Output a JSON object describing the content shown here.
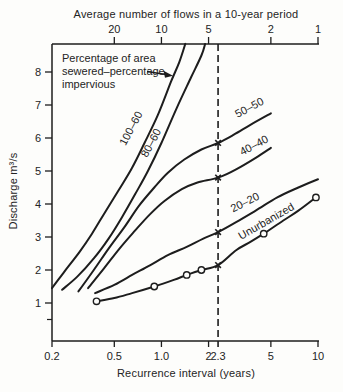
{
  "chart_data": {
    "type": "line",
    "top_axis_title": "Average number of flows in a 10-year period",
    "xlabel": "Recurrence interval (years)",
    "ylabel": "Discharge m³/s",
    "x_scale": "log",
    "xlim": [
      0.2,
      10
    ],
    "ylim": [
      0,
      9
    ],
    "grid": false,
    "x_ticks_bottom": [
      {
        "t": 0.2,
        "label": "0.2"
      },
      {
        "t": 0.5,
        "label": "0.5"
      },
      {
        "t": 1.0,
        "label": "1.0"
      },
      {
        "t": 2,
        "label": "2"
      },
      {
        "t": 2.3,
        "label": "2.3",
        "tick": false
      },
      {
        "t": 5,
        "label": "5"
      },
      {
        "t": 10,
        "label": "10"
      }
    ],
    "x_ticks_top": [
      {
        "t": 0.5,
        "label": "20"
      },
      {
        "t": 1,
        "label": "10"
      },
      {
        "t": 2,
        "label": "5"
      },
      {
        "t": 5,
        "label": "2"
      },
      {
        "t": 10,
        "label": "1"
      }
    ],
    "y_ticks": [
      1,
      2,
      3,
      4,
      5,
      6,
      7,
      8
    ],
    "y_minor_ticks": [
      0.5
    ],
    "reference_line": {
      "x": 2.3,
      "style": "dashed"
    },
    "annotation": {
      "lines": [
        "Percentage of area",
        "sewered–percentage",
        "impervious"
      ],
      "points_to": "100–60"
    },
    "series": [
      {
        "name": "100–60",
        "label_at": [
          0.67,
          6.24
        ],
        "label_angle": -62,
        "points": [
          [
            0.2,
            1.45
          ],
          [
            0.24,
            1.95
          ],
          [
            0.3,
            2.55
          ],
          [
            0.36,
            3.1
          ],
          [
            0.43,
            3.7
          ],
          [
            0.53,
            4.4
          ],
          [
            0.65,
            5.1
          ],
          [
            0.78,
            5.85
          ],
          [
            0.95,
            6.7
          ],
          [
            1.15,
            7.7
          ],
          [
            1.3,
            8.3
          ],
          [
            1.42,
            8.85
          ]
        ]
      },
      {
        "name": "80–60",
        "label_at": [
          0.9,
          5.8
        ],
        "label_angle": -62,
        "points": [
          [
            0.232,
            1.4
          ],
          [
            0.29,
            1.8
          ],
          [
            0.37,
            2.35
          ],
          [
            0.46,
            2.95
          ],
          [
            0.56,
            3.6
          ],
          [
            0.68,
            4.3
          ],
          [
            0.82,
            5.0
          ],
          [
            1.0,
            5.85
          ],
          [
            1.25,
            6.9
          ],
          [
            1.55,
            7.85
          ],
          [
            1.8,
            8.5
          ],
          [
            1.9,
            8.85
          ]
        ]
      },
      {
        "name": "50–50",
        "label_at": [
          3.74,
          6.82
        ],
        "label_angle": -28,
        "cross_at": 5.85,
        "points": [
          [
            0.295,
            1.35
          ],
          [
            0.37,
            2.0
          ],
          [
            0.46,
            2.65
          ],
          [
            0.58,
            3.3
          ],
          [
            0.72,
            3.95
          ],
          [
            0.9,
            4.5
          ],
          [
            1.1,
            4.95
          ],
          [
            1.4,
            5.35
          ],
          [
            1.8,
            5.65
          ],
          [
            2.3,
            5.85
          ],
          [
            2.9,
            6.1
          ],
          [
            3.7,
            6.4
          ],
          [
            5.0,
            6.75
          ]
        ]
      },
      {
        "name": "40–40",
        "label_at": [
          4.0,
          5.68
        ],
        "label_angle": -28,
        "cross_at": 4.8,
        "points": [
          [
            0.34,
            1.45
          ],
          [
            0.43,
            2.05
          ],
          [
            0.54,
            2.65
          ],
          [
            0.68,
            3.2
          ],
          [
            0.85,
            3.7
          ],
          [
            1.05,
            4.1
          ],
          [
            1.35,
            4.45
          ],
          [
            1.7,
            4.65
          ],
          [
            2.3,
            4.8
          ],
          [
            3.0,
            5.05
          ],
          [
            4.0,
            5.4
          ],
          [
            5.0,
            5.7
          ]
        ]
      },
      {
        "name": "20–20",
        "label_at": [
          3.5,
          3.95
        ],
        "label_angle": -27,
        "cross_at": 3.15,
        "points": [
          [
            0.377,
            1.3
          ],
          [
            0.5,
            1.55
          ],
          [
            0.65,
            1.85
          ],
          [
            0.85,
            2.15
          ],
          [
            1.1,
            2.45
          ],
          [
            1.45,
            2.7
          ],
          [
            1.85,
            2.95
          ],
          [
            2.3,
            3.15
          ],
          [
            3.0,
            3.45
          ],
          [
            4.0,
            3.8
          ],
          [
            5.5,
            4.2
          ],
          [
            7.5,
            4.5
          ],
          [
            10,
            4.75
          ]
        ]
      },
      {
        "name": "Unurbanized",
        "label_at": [
          4.8,
          3.38
        ],
        "label_angle": -30,
        "cross_at": 2.15,
        "marker": "circle",
        "marker_points": [
          [
            0.385,
            1.05
          ],
          [
            0.9,
            1.5
          ],
          [
            1.45,
            1.85
          ],
          [
            1.8,
            2.0
          ],
          [
            4.5,
            3.1
          ],
          [
            9.7,
            4.2
          ]
        ],
        "points": [
          [
            0.385,
            1.05
          ],
          [
            0.5,
            1.15
          ],
          [
            0.65,
            1.3
          ],
          [
            0.9,
            1.5
          ],
          [
            1.2,
            1.7
          ],
          [
            1.45,
            1.85
          ],
          [
            1.8,
            2.0
          ],
          [
            2.3,
            2.15
          ],
          [
            3.0,
            2.6
          ],
          [
            3.7,
            2.85
          ],
          [
            4.5,
            3.1
          ],
          [
            6.0,
            3.5
          ],
          [
            7.5,
            3.8
          ],
          [
            9.7,
            4.2
          ]
        ]
      }
    ],
    "colors": {
      "ink": "#1d1d1d",
      "text": "#242424",
      "background": "#fdfdfb"
    }
  }
}
